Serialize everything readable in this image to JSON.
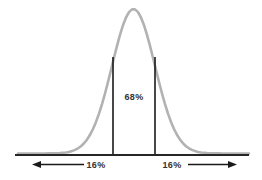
{
  "diagram": {
    "type": "normal-distribution-empirical-rule",
    "center_region_label": "68%",
    "left_tail_label": "16%",
    "right_tail_label": "16%"
  },
  "colors": {
    "background": "#ffffff",
    "curve": "#b2b2b2",
    "baseline": "#262626",
    "sigma_line": "#1a1a1a",
    "arrow": "#1a1a1a",
    "text": "#333333"
  }
}
